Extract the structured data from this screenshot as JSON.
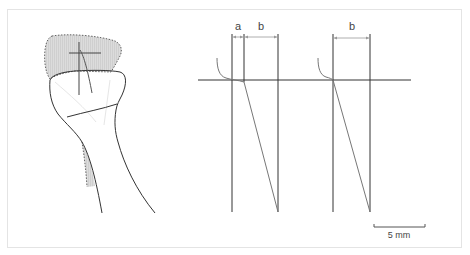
{
  "figure": {
    "panel_left": {
      "description": "bone head with shaded dotted region and crosshair"
    },
    "panel_middle": {
      "label_a": "a",
      "label_b": "b"
    },
    "panel_right": {
      "label_b": "b"
    },
    "scale_bar": {
      "label": "5 mm"
    },
    "colors": {
      "line": "#333333",
      "shade": "#d9d9d9",
      "diagonal": "#777777",
      "frame": "#e4e4e4"
    }
  }
}
